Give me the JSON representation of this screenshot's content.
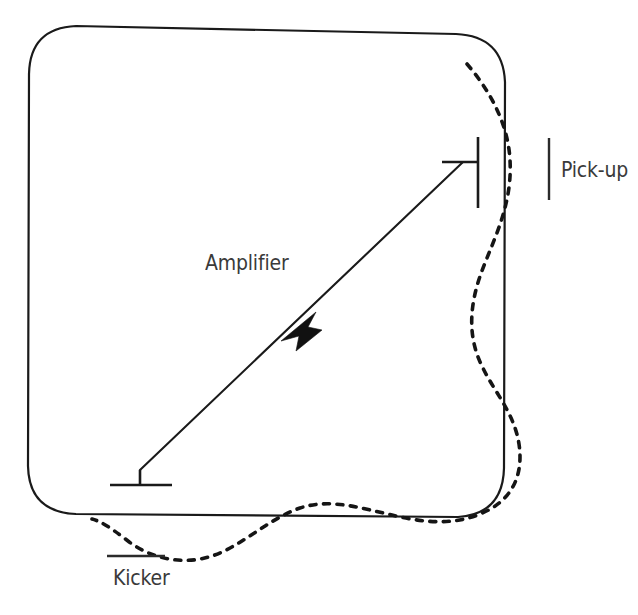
{
  "figure": {
    "background_color": "#ffffff",
    "line_color": "#1a1a1a",
    "label_color": "#3a3a3a",
    "dashed_color": "#151515"
  },
  "labels": {
    "amplifier": "Amplifier",
    "pickup": "Pick-up",
    "kicker": "Kicker"
  },
  "components": [
    {
      "id": "storage-ring",
      "name": "storage-ring",
      "kind": "closed-orbit-outline",
      "shape": "rounded-square",
      "description": "Solid rounded-square closed loop representing the accelerator ring / closed orbit",
      "bounds": {
        "x": 28,
        "y": 26,
        "width": 477,
        "height": 492
      },
      "corner_radius": 48
    },
    {
      "id": "beam-trajectory",
      "name": "beam-trajectory",
      "kind": "oscillating-beam",
      "style": "dashed",
      "description": "Dashed betatron oscillation of the beam about the closed orbit; enters at the pick-up, is damped after the kicker"
    },
    {
      "id": "pickup-electrode",
      "name": "pickup-electrode",
      "kind": "detector",
      "label": "Pick-up",
      "position": {
        "x": 478,
        "y": 175
      },
      "description": "Vertical electrode bar on the ring that senses the beam position"
    },
    {
      "id": "kicker-electrode",
      "name": "kicker-electrode",
      "kind": "actuator",
      "label": "Kicker",
      "position": {
        "x": 140,
        "y": 478
      },
      "description": "Horizontal electrode plate that deflects the beam to correct the oscillation"
    },
    {
      "id": "amplifier-path",
      "name": "amplifier-path",
      "kind": "signal-chain",
      "label": "Amplifier",
      "direction": "from pick-up to kicker",
      "description": "Chord across the ring carrying the amplified correction signal, arrow pointing toward the kicker"
    }
  ],
  "geometry": {
    "ring_path": "M 76 26 L 456 34 Q 503 36 505 82 L 504 468 Q 503 514 458 517 L 76 514 Q 29 512 28 466 L 29 74 Q 30 28 76 26 Z",
    "dashed_beam_path": "M 467 64 C 486 86 508 120 510 160 C 513 212 487 250 477 286 C 468 318 471 344 482 366 C 494 392 514 412 519 444 C 524 478 510 502 480 514 C 452 526 420 522 392 515 C 360 508 330 498 300 508 C 268 519 242 546 212 556 C 182 566 150 558 128 541 C 110 527 100 521 92 519",
    "amplifier_line": "M 478 162 L 463 162 L 140 470",
    "amplifier_arrow_tip": {
      "x": 281,
      "y": 340
    },
    "pickup_bar": {
      "x": 478,
      "y1": 137,
      "y2": 208
    },
    "pickup_stem": {
      "x1": 442,
      "y1": 162,
      "x2": 478,
      "y2": 162
    },
    "pickup_tick": {
      "x": 549,
      "y1": 138,
      "y2": 200
    },
    "kicker_bar": {
      "x1": 110,
      "y1": 485,
      "x2": 172,
      "y2": 485
    },
    "kicker_stem": {
      "x": 140,
      "y1": 470,
      "y2": 485
    },
    "kicker_tick": {
      "x1": 107,
      "y1": 556,
      "x2": 165,
      "y2": 556
    }
  }
}
